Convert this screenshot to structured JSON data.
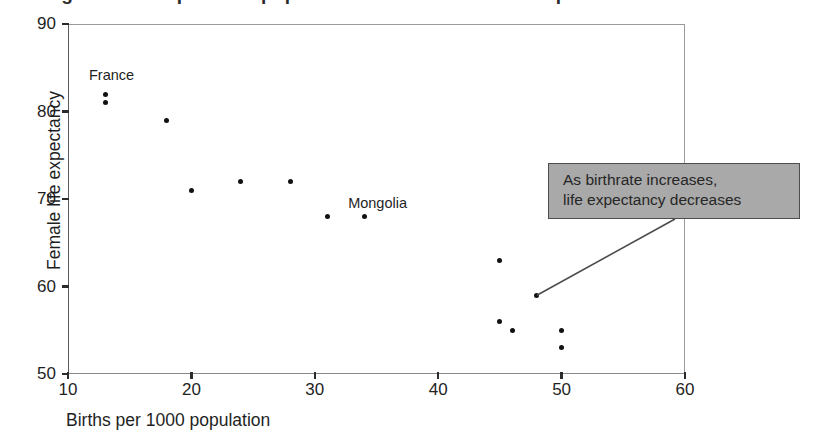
{
  "figure": {
    "title_fragment": "Figure: Births per 1000 population versus female life expectancy"
  },
  "chart_data": {
    "type": "scatter",
    "title": "",
    "xlabel": "Births per 1000 population",
    "ylabel": "Female life expectancy",
    "xlim": [
      10,
      60
    ],
    "ylim": [
      50,
      90
    ],
    "xticks": [
      10,
      20,
      30,
      40,
      50,
      60
    ],
    "yticks": [
      50,
      60,
      70,
      80,
      90
    ],
    "xtick_labels": [
      "10",
      "20",
      "30",
      "40",
      "50",
      "60"
    ],
    "ytick_labels": [
      "50",
      "60",
      "70",
      "80",
      "90"
    ],
    "grid": false,
    "legend": false,
    "series": [
      {
        "name": "Countries",
        "points": [
          {
            "x": 13,
            "y": 82,
            "label": ""
          },
          {
            "x": 13,
            "y": 81,
            "label": "France"
          },
          {
            "x": 18,
            "y": 79,
            "label": ""
          },
          {
            "x": 20,
            "y": 71,
            "label": ""
          },
          {
            "x": 24,
            "y": 72,
            "label": ""
          },
          {
            "x": 28,
            "y": 72,
            "label": ""
          },
          {
            "x": 31,
            "y": 68,
            "label": ""
          },
          {
            "x": 34,
            "y": 68,
            "label": "Mongolia"
          },
          {
            "x": 45,
            "y": 63,
            "label": ""
          },
          {
            "x": 48,
            "y": 59,
            "label": ""
          },
          {
            "x": 45,
            "y": 56,
            "label": ""
          },
          {
            "x": 46,
            "y": 55,
            "label": ""
          },
          {
            "x": 50,
            "y": 55,
            "label": ""
          },
          {
            "x": 50,
            "y": 53,
            "label": ""
          }
        ]
      }
    ],
    "point_labels": [
      {
        "text": "France",
        "x": 13,
        "y": 84.2
      },
      {
        "text": "Mongolia",
        "x": 34,
        "y": 69.6
      }
    ],
    "annotations": [
      {
        "text_lines": [
          "As birthrate increases,",
          "life expectancy decreases"
        ],
        "anchor_x": 48,
        "anchor_y": 59,
        "box_color": "#a9a9a9",
        "border_color": "#4d4d4d"
      }
    ],
    "colors": {
      "marker": "#111111",
      "axis": "#5a5a5a",
      "text": "#1f1f1f",
      "callout_fill": "#a9a9a9",
      "callout_border": "#4d4d4d",
      "leader_line": "#4d4d4d"
    }
  }
}
